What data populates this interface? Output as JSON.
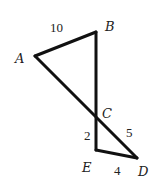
{
  "diagram": {
    "points": {
      "A": {
        "label": "A",
        "x": 35,
        "y": 56
      },
      "B": {
        "label": "B",
        "x": 96,
        "y": 32
      },
      "C": {
        "label": "C",
        "x": 96,
        "y": 120
      },
      "D": {
        "label": "D",
        "x": 137,
        "y": 158
      },
      "E": {
        "label": "E",
        "x": 96,
        "y": 150
      }
    },
    "segments": [
      {
        "from": "A",
        "to": "B",
        "length_label": "10"
      },
      {
        "from": "B",
        "to": "E"
      },
      {
        "from": "A",
        "to": "D"
      },
      {
        "from": "C",
        "to": "E",
        "length_label": "2"
      },
      {
        "from": "E",
        "to": "D",
        "length_label": "4"
      },
      {
        "from": "C",
        "to": "D",
        "length_label": "5"
      }
    ],
    "labels": {
      "AB": "10",
      "CE": "2",
      "CD": "5",
      "ED": "4"
    }
  }
}
